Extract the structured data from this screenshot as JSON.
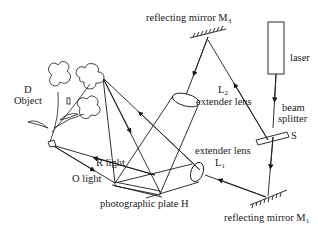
{
  "diagram": {
    "labels": {
      "mirror_m3": {
        "text": "reflecting mirror M",
        "sub": "3"
      },
      "laser": "laser",
      "beam_splitter_line1": "beam",
      "beam_splitter_line2": "splitter",
      "splitter_s": "S",
      "lens_l2_name": {
        "text": "L",
        "sub": "2"
      },
      "lens_l2_desc": "extender lens",
      "lens_l1_desc": "extender lens",
      "lens_l1_name": {
        "text": "L",
        "sub": "1"
      },
      "object_d": "D",
      "object_label": "Object",
      "r_light": "R light",
      "o_light": "O light",
      "plate": "photographic plate H",
      "mirror_m1": {
        "text": "reflecting mirror M",
        "sub": "1"
      }
    },
    "colors": {
      "line": "#1a1a1a",
      "background": "#ffffff"
    }
  }
}
